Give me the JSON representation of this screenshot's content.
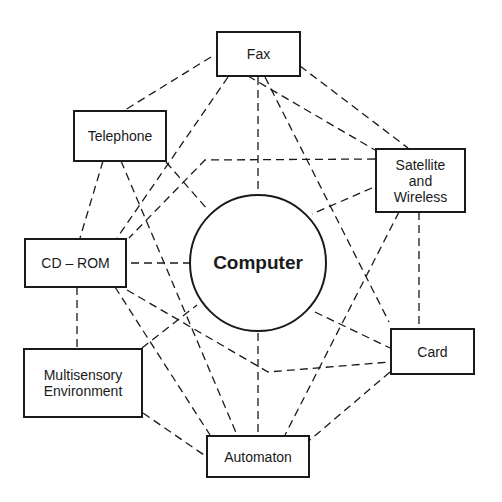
{
  "diagram": {
    "hub": {
      "label": "Computer"
    },
    "nodes": [
      {
        "id": "fax",
        "label": "Fax"
      },
      {
        "id": "telephone",
        "label": "Telephone"
      },
      {
        "id": "satellite",
        "label": "Satellite\nand\nWireless"
      },
      {
        "id": "cdrom",
        "label": "CD – ROM"
      },
      {
        "id": "card",
        "label": "Card"
      },
      {
        "id": "multisensory",
        "label": "Multisensory\nEnvironment"
      },
      {
        "id": "automaton",
        "label": "Automaton"
      }
    ],
    "edge_style": "dashed",
    "colors": {
      "stroke": "#1a1a1a",
      "background": "#ffffff"
    }
  }
}
